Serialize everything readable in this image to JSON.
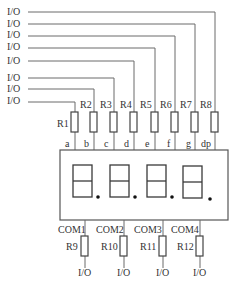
{
  "colors": {
    "wire": "#6a6a6a",
    "text": "#333333",
    "segment": "#3a3a3a"
  },
  "segment_inputs": [
    {
      "io_label": "I/O",
      "resistor": "R8",
      "segment": "dp"
    },
    {
      "io_label": "I/O",
      "resistor": "R7",
      "segment": "g"
    },
    {
      "io_label": "I/O",
      "resistor": "R6",
      "segment": "f"
    },
    {
      "io_label": "I/O",
      "resistor": "R5",
      "segment": "e"
    },
    {
      "io_label": "I/O",
      "resistor": "R4",
      "segment": "d"
    },
    {
      "io_label": "I/O",
      "resistor": "R3",
      "segment": "c"
    },
    {
      "io_label": "I/O",
      "resistor": "R2",
      "segment": "b"
    },
    {
      "io_label": "I/O",
      "resistor": "R1",
      "segment": "a"
    }
  ],
  "resistors_top": [
    "R1",
    "R2",
    "R3",
    "R4",
    "R5",
    "R6",
    "R7",
    "R8"
  ],
  "segments": [
    "a",
    "b",
    "c",
    "d",
    "e",
    "f",
    "g",
    "dp"
  ],
  "display": {
    "digits": 4,
    "digit_glyph": "8."
  },
  "commons": [
    {
      "com": "COM1",
      "resistor": "R9",
      "io_label": "I/O"
    },
    {
      "com": "COM2",
      "resistor": "R10",
      "io_label": "I/O"
    },
    {
      "com": "COM3",
      "resistor": "R11",
      "io_label": "I/O"
    },
    {
      "com": "COM4",
      "resistor": "R12",
      "io_label": "I/O"
    }
  ]
}
